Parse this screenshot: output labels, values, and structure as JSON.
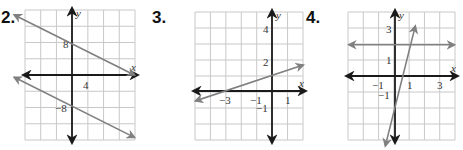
{
  "exercises": [
    {
      "number": "2.",
      "num_pos": [
        1,
        8
      ],
      "grid": {
        "left": 25,
        "top": 10,
        "right": 135,
        "bottom": 140,
        "cols": 7,
        "rows": 8
      },
      "axes": {
        "origin_px": [
          72,
          75
        ],
        "unit_px": 7.8,
        "x_label": "x",
        "y_label": "y"
      },
      "ticks": [
        {
          "text": "8",
          "x": 63,
          "y": 48
        },
        {
          "text": "4",
          "x": 83,
          "y": 89
        },
        {
          "text": "−8",
          "x": 55,
          "y": 112
        }
      ],
      "lines": [
        {
          "name": "upper-line",
          "slope": -0.5,
          "intercept": 4,
          "x_range": [
            -7.4,
            8.0
          ],
          "color": "#808080"
        },
        {
          "name": "lower-line",
          "slope": -0.5,
          "intercept": -4,
          "x_range": [
            -7.4,
            8.0
          ],
          "color": "#808080"
        }
      ]
    },
    {
      "number": "3.",
      "num_pos": [
        152,
        8
      ],
      "grid": {
        "left": 195,
        "top": 12,
        "right": 303,
        "bottom": 140,
        "cols": 7,
        "rows": 8
      },
      "axes": {
        "origin_px": [
          272,
          91
        ],
        "unit_px": 15.6,
        "x_label": "x",
        "y_label": "y"
      },
      "ticks": [
        {
          "text": "4",
          "x": 263,
          "y": 33
        },
        {
          "text": "2",
          "x": 263,
          "y": 66
        },
        {
          "text": "−3",
          "x": 219,
          "y": 104
        },
        {
          "text": "−1",
          "x": 250,
          "y": 104
        },
        {
          "text": "1",
          "x": 285,
          "y": 104
        },
        {
          "text": "−1",
          "x": 256,
          "y": 112
        }
      ],
      "lines": [
        {
          "name": "rising-line",
          "slope": 0.3333,
          "intercept": 1,
          "x_range": [
            -4.9,
            2.0
          ],
          "color": "#808080"
        }
      ]
    },
    {
      "number": "4.",
      "num_pos": [
        306,
        8
      ],
      "grid": {
        "left": 348,
        "top": 12,
        "right": 455,
        "bottom": 140,
        "cols": 7,
        "rows": 8
      },
      "axes": {
        "origin_px": [
          395,
          76
        ],
        "unit_px": 15.6,
        "x_label": "x",
        "y_label": "y"
      },
      "ticks": [
        {
          "text": "3",
          "x": 386,
          "y": 33
        },
        {
          "text": "1",
          "x": 386,
          "y": 64
        },
        {
          "text": "−1",
          "x": 372,
          "y": 89
        },
        {
          "text": "1",
          "x": 407,
          "y": 89
        },
        {
          "text": "3",
          "x": 437,
          "y": 89
        },
        {
          "text": "−1",
          "x": 378,
          "y": 99
        }
      ],
      "lines": [
        {
          "name": "horizontal-line",
          "slope": 0,
          "intercept": 2,
          "x_range": [
            -2.95,
            3.8
          ],
          "color": "#808080"
        },
        {
          "name": "steep-line",
          "slope": 4,
          "intercept": -2,
          "x_range": [
            -0.62,
            1.3
          ],
          "color": "#808080"
        }
      ]
    }
  ],
  "colors": {
    "grid": "#c8c8c8",
    "axis": "#1a1a1a",
    "line": "#808080",
    "number": "#111111"
  }
}
